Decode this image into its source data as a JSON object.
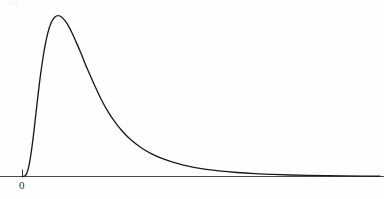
{
  "figure": {
    "background_color": "#fefefe",
    "curve_color": "#1a1a1a",
    "axis_color": "#4a4a4a",
    "origin_label": "0"
  },
  "chart_data": {
    "type": "line",
    "title": "",
    "subtitle": "",
    "xlabel": "",
    "ylabel": "",
    "grid": false,
    "legend": null,
    "annotations": [],
    "axis": {
      "x_axis_visible": true,
      "y_axis_visible": false,
      "x_tick_values": [
        0
      ],
      "x_tick_labels": [
        "0"
      ],
      "y_tick_values": [],
      "y_tick_labels": [],
      "xlim": [
        0,
        10
      ],
      "ylim": [
        0,
        1.05
      ]
    },
    "series": [
      {
        "name": "density",
        "x": [
          0.0,
          0.05,
          0.1,
          0.15,
          0.2,
          0.25,
          0.3,
          0.35,
          0.4,
          0.45,
          0.5,
          0.6,
          0.7,
          0.8,
          0.9,
          1.0,
          1.1,
          1.2,
          1.3,
          1.4,
          1.5,
          1.6,
          1.7,
          1.8,
          1.9,
          2.0,
          2.2,
          2.4,
          2.6,
          2.8,
          3.0,
          3.3,
          3.6,
          3.9,
          4.2,
          4.5,
          5.0,
          5.5,
          6.0,
          6.5,
          7.0,
          7.5,
          8.0,
          8.5,
          9.0,
          9.5,
          10.0
        ],
        "y": [
          0.0,
          0.002,
          0.012,
          0.04,
          0.09,
          0.16,
          0.245,
          0.34,
          0.44,
          0.535,
          0.625,
          0.775,
          0.885,
          0.955,
          0.99,
          1.0,
          0.99,
          0.965,
          0.93,
          0.885,
          0.835,
          0.785,
          0.73,
          0.675,
          0.625,
          0.575,
          0.48,
          0.4,
          0.335,
          0.28,
          0.235,
          0.182,
          0.142,
          0.112,
          0.089,
          0.071,
          0.049,
          0.035,
          0.025,
          0.018,
          0.013,
          0.0095,
          0.007,
          0.005,
          0.0035,
          0.0025,
          0.0018
        ]
      }
    ]
  }
}
